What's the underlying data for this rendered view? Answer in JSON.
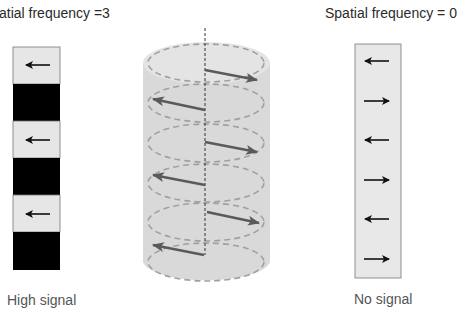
{
  "left_panel": {
    "title": "atial frequency =3",
    "caption": "High signal",
    "segments": [
      {
        "fill": "light",
        "arrow": "left"
      },
      {
        "fill": "dark",
        "arrow": "none"
      },
      {
        "fill": "light",
        "arrow": "left"
      },
      {
        "fill": "dark",
        "arrow": "none"
      },
      {
        "fill": "light",
        "arrow": "left"
      },
      {
        "fill": "dark",
        "arrow": "none"
      }
    ]
  },
  "center_panel": {
    "shape": "cylinder",
    "slices": 6,
    "arrow_directions": [
      "right",
      "left",
      "right",
      "left",
      "right",
      "left"
    ]
  },
  "right_panel": {
    "title": "Spatial frequency = 0",
    "caption": "No signal",
    "arrow_directions": [
      "left",
      "right",
      "left",
      "right",
      "left",
      "right"
    ]
  },
  "colors": {
    "light_segment": "#e6e6e6",
    "dark_segment": "#000000",
    "cylinder_fill": "#d9d9d9",
    "cylinder_top": "#e4e4e4",
    "dashed_ellipse": "#a0a0a0",
    "cylinder_arrow": "#5a5a5a",
    "strip_arrow": "#111111"
  }
}
